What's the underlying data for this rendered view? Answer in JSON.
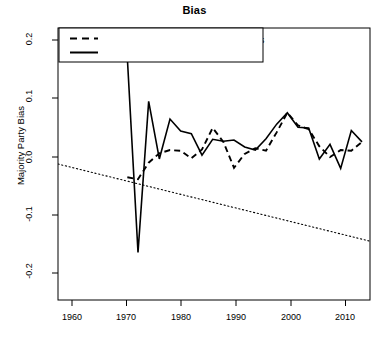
{
  "chart_data": {
    "type": "line",
    "title": "Bias",
    "xlabel": "",
    "ylabel": "Majority Party Bias",
    "xlim": [
      1956,
      1914.5
    ],
    "x_axis_range": [
      1956,
      2014.5
    ],
    "ylim": [
      -0.215,
      0.215
    ],
    "grid": false,
    "xticks": [
      1960,
      1970,
      1980,
      1990,
      2000,
      2010
    ],
    "xtick_labels": [
      "1960",
      "1970",
      "1980",
      "1990",
      "2000",
      "2010"
    ],
    "yticks": [
      -0.2,
      -0.1,
      0.0,
      0.1,
      0.2
    ],
    "ytick_labels": [
      "-0.2",
      "-0.1",
      "0.0",
      "0.1",
      "0.2"
    ],
    "legend_position": "top-left",
    "series": [
      {
        "name": "Weighted Mean of Parent Committee Bias",
        "style": "dashed",
        "color": "#000000",
        "x": [
          1969,
          1971,
          1973,
          1975,
          1977,
          1979,
          1981,
          1983,
          1985,
          1987,
          1989,
          1991,
          1993,
          1995,
          1997,
          1999,
          2001,
          2003,
          2005,
          2007,
          2009,
          2011,
          2013
        ],
        "values": [
          -0.021,
          -0.024,
          0.002,
          0.017,
          0.022,
          0.021,
          0.009,
          0.023,
          0.057,
          0.035,
          -0.006,
          0.016,
          0.025,
          0.021,
          0.05,
          0.081,
          0.061,
          0.055,
          0.028,
          0.011,
          0.022,
          0.021,
          0.035
        ]
      },
      {
        "name": "Mean of Conference Bias",
        "style": "solid",
        "color": "#000000",
        "x": [
          1969,
          1971,
          1973,
          1975,
          1977,
          1979,
          1981,
          1983,
          1985,
          1987,
          1989,
          1991,
          1993,
          1995,
          1997,
          1999,
          2001,
          2003,
          2005,
          2007,
          2009,
          2011,
          2013
        ],
        "values": [
          0.168,
          -0.14,
          0.099,
          0.008,
          0.071,
          0.052,
          0.048,
          0.014,
          0.039,
          0.036,
          0.038,
          0.027,
          0.022,
          0.04,
          0.063,
          0.081,
          0.058,
          0.057,
          0.008,
          0.031,
          -0.007,
          0.053,
          0.035
        ]
      },
      {
        "name": "Trend",
        "style": "dotted",
        "color": "#000000",
        "x": [
          1956,
          2014.5
        ],
        "values": [
          0.0,
          -0.122
        ]
      }
    ]
  },
  "legend": {
    "entries": [
      {
        "label": "Weighted Mean of Parent Committee Bias",
        "style": "dashed"
      },
      {
        "label": "Mean of Conference Bias",
        "style": "solid"
      }
    ]
  },
  "axis": {
    "y_title": "Majority Party Bias",
    "ytick_labels": [
      "0.2",
      "0.1",
      "0.0",
      "-0.1",
      "-0.2"
    ],
    "xtick_labels": [
      "1960",
      "1970",
      "1980",
      "1990",
      "2000",
      "2010"
    ]
  },
  "title": "Bias"
}
